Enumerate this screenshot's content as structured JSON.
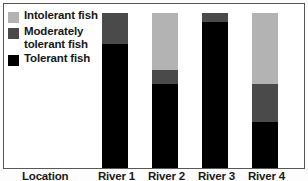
{
  "chart_data": {
    "type": "bar",
    "title": "",
    "subtitle": "",
    "xlabel": "Location",
    "ylabel": "",
    "stacked": true,
    "grid": false,
    "legend_position": "top-left",
    "ylim": [
      0,
      100
    ],
    "categories": [
      "River 1",
      "River 2",
      "River 3",
      "River 4"
    ],
    "series": [
      {
        "name": "Tolerant fish",
        "color": "#000000",
        "values": [
          80,
          54,
          94,
          30
        ]
      },
      {
        "name": "Moderately tolerant fish",
        "color": "#4a4a4a",
        "values": [
          20,
          9,
          6,
          24
        ]
      },
      {
        "name": "Intolerant fish",
        "color": "#b3b3b3",
        "values": [
          0,
          37,
          0,
          46
        ]
      }
    ],
    "annotations": []
  },
  "legend": {
    "items": [
      {
        "label": "Intolerant fish",
        "color": "#b3b3b3",
        "swatch_name": "legend-swatch-intolerant"
      },
      {
        "label": "Moderately tolerant fish",
        "color": "#4a4a4a",
        "swatch_name": "legend-swatch-moderately-tolerant"
      },
      {
        "label": "Tolerant fish",
        "color": "#000000",
        "swatch_name": "legend-swatch-tolerant"
      }
    ]
  },
  "axis": {
    "caption": "Location",
    "tick_labels": [
      "River 1",
      "River 2",
      "River 3",
      "River 4"
    ]
  },
  "colors": {
    "intolerant": "#b3b3b3",
    "moderately_tolerant": "#4a4a4a",
    "tolerant": "#000000",
    "frame": "#58585a",
    "background": "#ffffff"
  }
}
